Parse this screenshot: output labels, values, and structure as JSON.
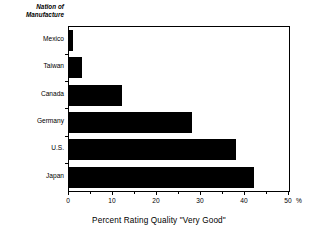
{
  "chart_data": {
    "type": "bar",
    "orientation": "horizontal",
    "title": "",
    "xlabel": "Percent Rating Quality \"Very Good\"",
    "ylabel": "Nation of Manufacture",
    "ylabel_line1": "Nation of",
    "ylabel_line2": "Manufacture",
    "categories": [
      "Mexico",
      "Taiwan",
      "Canada",
      "Germany",
      "U.S.",
      "Japan"
    ],
    "values": [
      1,
      3,
      12,
      28,
      38,
      42
    ],
    "xlim": [
      0,
      50
    ],
    "xticks": [
      0,
      10,
      20,
      30,
      40,
      50
    ],
    "xtick_labels": [
      "0",
      "10",
      "20",
      "30",
      "40",
      "50"
    ],
    "x_minor_ticks": [
      5,
      15,
      25,
      35,
      45
    ],
    "x_unit": "%",
    "grid": false,
    "legend": false,
    "bar_color": "#000000",
    "frame_color": "#000000",
    "background": "#ffffff"
  }
}
